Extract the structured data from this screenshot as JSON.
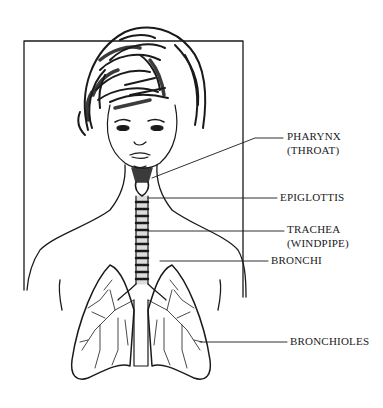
{
  "diagram": {
    "labels": {
      "pharynx": "PHARYNX",
      "pharynx_sub": "(THROAT)",
      "epiglottis": "EPIGLOTTIS",
      "trachea": "TRACHEA",
      "trachea_sub": "(WINDPIPE)",
      "bronchi": "BRONCHI",
      "bronchioles": "BRONCHIOLES"
    },
    "colors": {
      "ink": "#1a1a1a",
      "background": "#ffffff"
    }
  }
}
